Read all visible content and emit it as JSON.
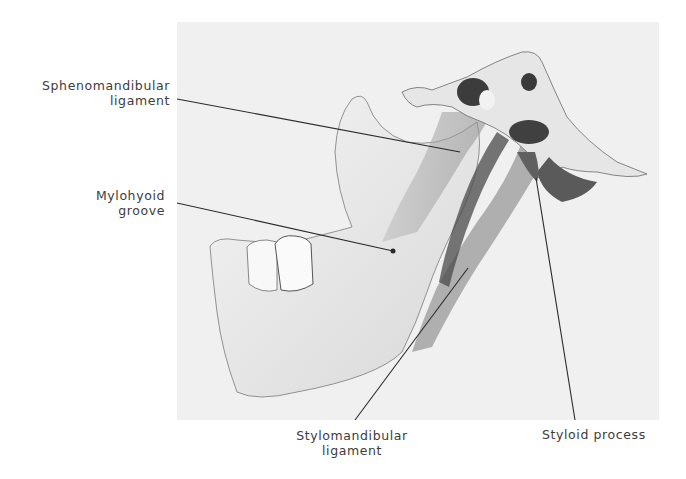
{
  "figure": {
    "background_color": "#f0f0f0",
    "line_color": "#2a2a2a"
  },
  "labels": [
    {
      "id": "sphenomandibular",
      "line1": "Sphenomandibular",
      "line2": "ligament"
    },
    {
      "id": "mylohyoid",
      "line1": "Mylohyoid",
      "line2": "groove"
    },
    {
      "id": "stylomandibular",
      "line1": "Stylomandibular",
      "line2": "ligament"
    },
    {
      "id": "styloid",
      "line1": "Styloid process"
    }
  ]
}
